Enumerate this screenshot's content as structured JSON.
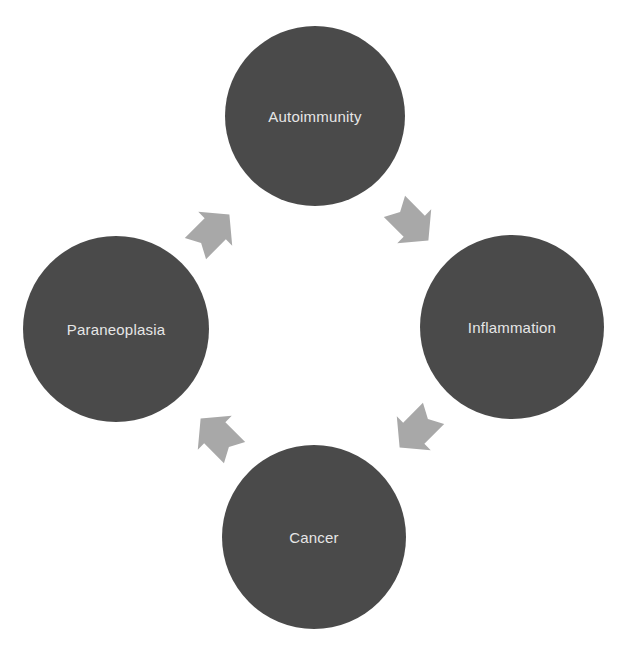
{
  "diagram": {
    "type": "cycle",
    "nodes": [
      {
        "id": "autoimmunity",
        "label": "Autoimmunity",
        "cx": 315,
        "cy": 116,
        "r": 90
      },
      {
        "id": "inflammation",
        "label": "Inflammation",
        "cx": 512,
        "cy": 327,
        "r": 92
      },
      {
        "id": "cancer",
        "label": "Cancer",
        "cx": 314,
        "cy": 537,
        "r": 92
      },
      {
        "id": "paraneoplasia",
        "label": "Paraneoplasia",
        "cx": 116,
        "cy": 329,
        "r": 93
      }
    ],
    "edges": [
      {
        "from": "autoimmunity",
        "to": "inflammation",
        "direction": "down-right"
      },
      {
        "from": "inflammation",
        "to": "cancer",
        "direction": "down-left"
      },
      {
        "from": "cancer",
        "to": "paraneoplasia",
        "direction": "up-left"
      },
      {
        "from": "paraneoplasia",
        "to": "autoimmunity",
        "direction": "up-right"
      }
    ],
    "colors": {
      "node_fill": "#4a4a4a",
      "node_text": "#e6e6e6",
      "arrow_fill": "#a8a8a8",
      "background": "#ffffff"
    }
  }
}
